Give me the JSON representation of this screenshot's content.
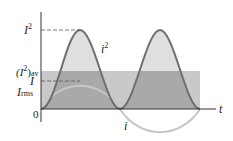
{
  "diagram": {
    "title": "",
    "axes": {
      "x_label": "t",
      "origin_label": "0"
    },
    "labels": {
      "i_squared_peak": "I",
      "i_squared_peak_sup": "2",
      "i_squared_avg_open": "(I",
      "i_squared_avg_sup": "2",
      "i_squared_avg_close": ")",
      "i_squared_avg_sub": "av",
      "amplitude": "I",
      "rms": "I",
      "rms_sub": "rms",
      "curve_i_squared": "i",
      "curve_i_squared_sup": "2",
      "curve_i": "i"
    },
    "colors": {
      "i_squared_curve": "#6e6e6e",
      "i_squared_fill": "#d2d2d2",
      "avg_band": "#b8b8b8",
      "i_curve": "#c8c8c8",
      "axis": "#333333"
    }
  }
}
